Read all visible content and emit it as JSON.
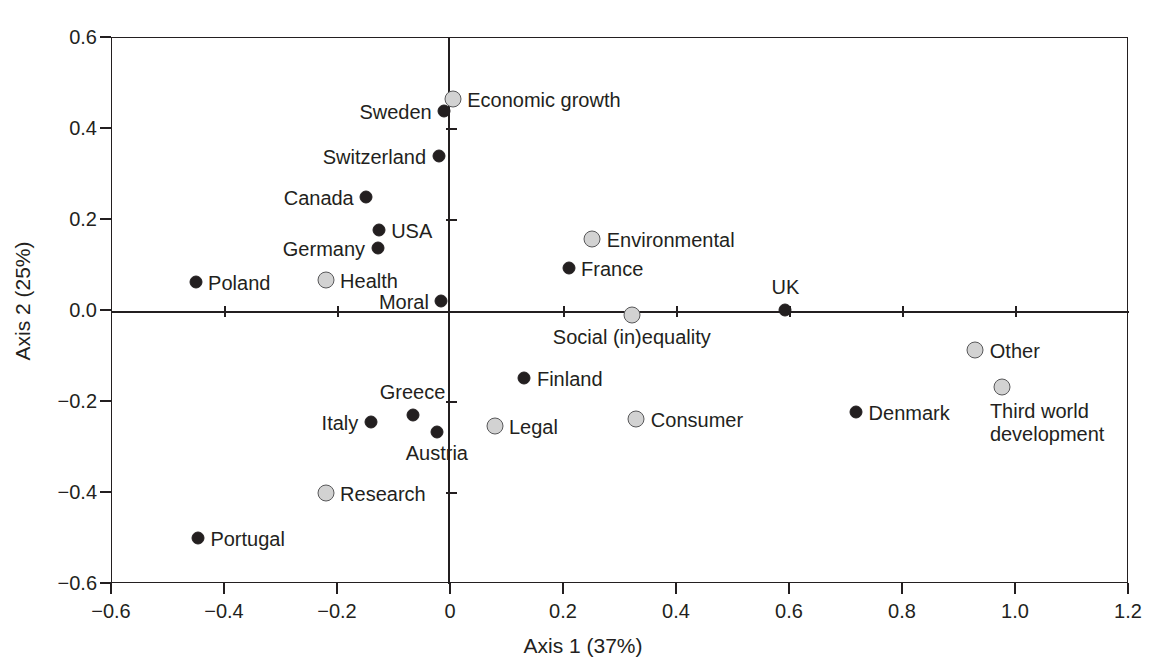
{
  "chart_data": {
    "type": "scatter",
    "title": "",
    "xlabel": "Axis 1 (37%)",
    "ylabel": "Axis 2 (25%)",
    "xlim": [
      -0.6,
      1.2
    ],
    "ylim": [
      -0.6,
      0.6
    ],
    "xticks": [
      "-0.6",
      "-0.4",
      "-0.2",
      "0",
      "0.2",
      "0.4",
      "0.6",
      "0.8",
      "1.0",
      "1.2"
    ],
    "xtick_values": [
      -0.6,
      -0.4,
      -0.2,
      0,
      0.2,
      0.4,
      0.6,
      0.8,
      1.0,
      1.2
    ],
    "yticks": [
      "0.6",
      "0.4",
      "0.2",
      "0.0",
      "-0.2",
      "-0.4",
      "-0.6"
    ],
    "ytick_values": [
      0.6,
      0.4,
      0.2,
      0.0,
      -0.2,
      -0.4,
      -0.6
    ],
    "grid": false,
    "legend": "none",
    "zero_axes": true,
    "series": [
      {
        "name": "Countries",
        "marker": "filled-circle",
        "color": "#231f20",
        "points": [
          {
            "label": "Sweden",
            "x": -0.012,
            "y": 0.44,
            "label_pos": "left"
          },
          {
            "label": "Switzerland",
            "x": -0.022,
            "y": 0.34,
            "label_pos": "left"
          },
          {
            "label": "Canada",
            "x": -0.15,
            "y": 0.25,
            "label_pos": "left"
          },
          {
            "label": "USA",
            "x": -0.128,
            "y": 0.177,
            "label_pos": "right"
          },
          {
            "label": "Germany",
            "x": -0.13,
            "y": 0.138,
            "label_pos": "left"
          },
          {
            "label": "Poland",
            "x": -0.452,
            "y": 0.063,
            "label_pos": "right"
          },
          {
            "label": "Moral",
            "x": -0.017,
            "y": 0.023,
            "label_pos": "left"
          },
          {
            "label": "France",
            "x": 0.208,
            "y": 0.095,
            "label_pos": "right"
          },
          {
            "label": "UK",
            "x": 0.592,
            "y": 0.003,
            "label_pos": "top"
          },
          {
            "label": "Finland",
            "x": 0.13,
            "y": -0.148,
            "label_pos": "right"
          },
          {
            "label": "Greece",
            "x": -0.068,
            "y": -0.228,
            "label_pos": "top"
          },
          {
            "label": "Italy",
            "x": -0.142,
            "y": -0.243,
            "label_pos": "left"
          },
          {
            "label": "Austria",
            "x": -0.025,
            "y": -0.267,
            "label_pos": "bottom"
          },
          {
            "label": "Denmark",
            "x": 0.717,
            "y": -0.222,
            "label_pos": "right"
          },
          {
            "label": "Portugal",
            "x": -0.448,
            "y": -0.498,
            "label_pos": "right"
          }
        ]
      },
      {
        "name": "Issue categories",
        "marker": "open-circle",
        "color": "#d2d2d2",
        "points": [
          {
            "label": "Economic growth",
            "x": 0.003,
            "y": 0.465,
            "label_pos": "right"
          },
          {
            "label": "Health",
            "x": -0.222,
            "y": 0.068,
            "label_pos": "right"
          },
          {
            "label": "Environmental",
            "x": 0.25,
            "y": 0.158,
            "label_pos": "right"
          },
          {
            "label": "Social (in)equality",
            "x": 0.32,
            "y": -0.008,
            "label_pos": "bottom"
          },
          {
            "label": "Other",
            "x": 0.928,
            "y": -0.085,
            "label_pos": "right"
          },
          {
            "label": "Third world\ndevelopment",
            "x": 0.975,
            "y": -0.168,
            "label_pos": "below-left"
          },
          {
            "label": "Legal",
            "x": 0.077,
            "y": -0.252,
            "label_pos": "right"
          },
          {
            "label": "Consumer",
            "x": 0.328,
            "y": -0.237,
            "label_pos": "right"
          },
          {
            "label": "Research",
            "x": -0.222,
            "y": -0.4,
            "label_pos": "right"
          }
        ]
      }
    ]
  },
  "colors": {
    "axis": "#231f20",
    "country_marker": "#231f20",
    "category_marker_fill": "#d2d2d2",
    "category_marker_stroke": "#58585a",
    "background": "#ffffff"
  }
}
